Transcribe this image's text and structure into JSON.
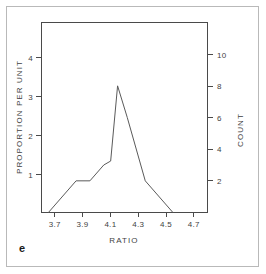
{
  "figure": {
    "panel_letter": "e",
    "frame_color": "#b9b9b9",
    "line_color": "#5a5a5a",
    "axis_color": "#4a4a4a"
  },
  "chart_data": {
    "type": "line",
    "title": "",
    "subtitle": "",
    "xlabel": "RATIO",
    "ylabel": "PROPORTION PER UNIT",
    "y2label": "COUNT",
    "grid": false,
    "legend": "none",
    "xlim": [
      3.6,
      4.8
    ],
    "ylim": [
      0,
      4.8
    ],
    "y2lim": [
      0,
      12
    ],
    "xticks": [
      3.7,
      3.9,
      4.1,
      4.3,
      4.5,
      4.7
    ],
    "xticklabels": [
      "3.7",
      "3.9",
      "4.1",
      "4.3",
      "4.5",
      "4.7"
    ],
    "yticks": [
      1,
      2,
      3,
      4
    ],
    "yticklabels": [
      "1",
      "2",
      "3",
      "4"
    ],
    "y2ticks": [
      2,
      4,
      6,
      8,
      10
    ],
    "y2ticklabels": [
      "2",
      "4",
      "6",
      "8",
      "10"
    ],
    "series": [
      {
        "name": "frequency polygon",
        "x": [
          3.65,
          3.85,
          3.95,
          4.05,
          4.1,
          4.15,
          4.22,
          4.35,
          4.55
        ],
        "y": [
          0.0,
          0.8,
          0.8,
          1.2,
          1.3,
          3.2,
          2.4,
          0.8,
          0.0
        ],
        "counts": [
          0,
          2,
          2,
          3,
          3.25,
          8,
          6,
          2,
          0
        ]
      }
    ]
  }
}
